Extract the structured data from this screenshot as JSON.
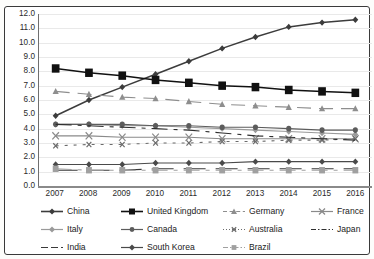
{
  "title_sliver": "",
  "chart_data": {
    "type": "line",
    "title": "",
    "subtitle": "",
    "xlabel": "",
    "ylabel": "",
    "x": [
      "2007",
      "2008",
      "2009",
      "2010",
      "2011",
      "2012",
      "2013",
      "2014",
      "2015",
      "2016"
    ],
    "categories": [
      "2007",
      "2008",
      "2009",
      "2010",
      "2011",
      "2012",
      "2013",
      "2014",
      "2015",
      "2016"
    ],
    "ylim": [
      0.0,
      12.0
    ],
    "ytick_step": 1.0,
    "yticks": [
      "12.0",
      "11.0",
      "10.0",
      "9.0",
      "8.0",
      "7.0",
      "6.0",
      "5.0",
      "4.0",
      "3.0",
      "2.0",
      "1.0",
      "0.0"
    ],
    "grid": true,
    "legend_position": "bottom",
    "series": [
      {
        "name": "China",
        "marker": "diamond",
        "dash": "solid",
        "color": "#3c3c3c",
        "values": [
          4.9,
          6.0,
          6.9,
          7.8,
          8.7,
          9.6,
          10.4,
          11.1,
          11.4,
          11.6
        ]
      },
      {
        "name": "United Kingdom",
        "marker": "square-large",
        "dash": "solid",
        "color": "#111111",
        "values": [
          8.2,
          7.9,
          7.7,
          7.4,
          7.2,
          7.0,
          6.9,
          6.7,
          6.6,
          6.5
        ]
      },
      {
        "name": "Germany",
        "marker": "triangle",
        "dash": "dash",
        "color": "#8e8e8e",
        "values": [
          6.6,
          6.4,
          6.2,
          6.1,
          5.9,
          5.7,
          5.6,
          5.5,
          5.4,
          5.4
        ]
      },
      {
        "name": "France",
        "marker": "cross",
        "dash": "solid",
        "color": "#8a8a8a",
        "values": [
          3.5,
          3.5,
          3.4,
          3.4,
          3.4,
          3.3,
          3.3,
          3.3,
          3.3,
          3.3
        ]
      },
      {
        "name": "Italy",
        "marker": "diamond",
        "dash": "solid",
        "color": "#9a9a9a",
        "values": [
          4.3,
          4.3,
          4.2,
          4.2,
          4.1,
          4.0,
          3.9,
          3.8,
          3.7,
          3.6
        ]
      },
      {
        "name": "Canada",
        "marker": "circle",
        "dash": "solid",
        "color": "#5c5c5c",
        "values": [
          4.3,
          4.3,
          4.3,
          4.2,
          4.2,
          4.1,
          4.1,
          4.0,
          3.9,
          3.9
        ]
      },
      {
        "name": "Australia",
        "marker": "cross-small",
        "dash": "dot",
        "color": "#6b6b6b",
        "values": [
          2.8,
          2.9,
          2.9,
          3.0,
          3.0,
          3.1,
          3.1,
          3.2,
          3.2,
          3.3
        ]
      },
      {
        "name": "Japan",
        "marker": "none",
        "dash": "dashdot",
        "color": "#2f2f2f",
        "values": [
          4.3,
          4.2,
          4.1,
          4.0,
          3.9,
          3.7,
          3.5,
          3.4,
          3.3,
          3.2
        ]
      },
      {
        "name": "India",
        "marker": "none",
        "dash": "longdash",
        "color": "#3a3a3a",
        "values": [
          1.1,
          1.1,
          1.1,
          1.2,
          1.2,
          1.2,
          1.2,
          1.2,
          1.2,
          1.2
        ]
      },
      {
        "name": "South Korea",
        "marker": "diamond",
        "dash": "solid",
        "color": "#4a4a4a",
        "values": [
          1.5,
          1.5,
          1.5,
          1.6,
          1.6,
          1.6,
          1.7,
          1.7,
          1.7,
          1.7
        ]
      },
      {
        "name": "Brazil",
        "marker": "square",
        "dash": "dashdot",
        "color": "#a0a0a0",
        "values": [
          1.2,
          1.1,
          1.1,
          1.1,
          1.1,
          1.1,
          1.1,
          1.1,
          1.1,
          1.1
        ]
      }
    ]
  },
  "legend": {
    "rows": [
      [
        "China",
        "United Kingdom",
        "Germany",
        "France"
      ],
      [
        "Italy",
        "Canada",
        "Australia",
        "Japan"
      ],
      [
        "India",
        "South Korea",
        "Brazil"
      ]
    ]
  }
}
